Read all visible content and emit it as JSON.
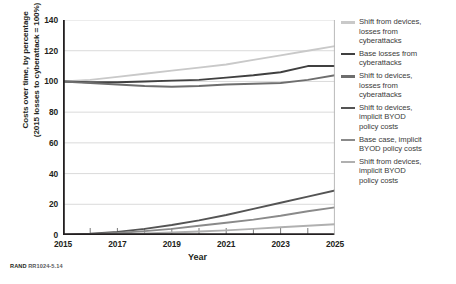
{
  "figure": {
    "source_note_prefix": "RAND",
    "source_note_id": " RR1024-5.14"
  },
  "axes": {
    "y_title_line1": "Costs over time, by percentage",
    "y_title_line2": "(2015 losses to cyberattack = 100%)",
    "x_title": "Year",
    "y_ticks": [
      "140",
      "120",
      "100",
      "80",
      "60",
      "40",
      "20",
      "0"
    ],
    "x_ticks": [
      "2015",
      "2017",
      "2019",
      "2021",
      "2023",
      "2025"
    ]
  },
  "legend": {
    "items": [
      {
        "label": "Shift from devices,\nlosses from\ncyberattacks",
        "color": "#c9c9c9"
      },
      {
        "label": "Base losses from\ncyberattacks",
        "color": "#404040"
      },
      {
        "label": "Shift to devices,\nlosses from\ncyberattacks",
        "color": "#6e6e6e"
      },
      {
        "label": "Shift to devices,\nimplicit BYOD\npolicy costs",
        "color": "#545454"
      },
      {
        "label": "Base case, implicit\nBYOD policy costs",
        "color": "#8a8a8a"
      },
      {
        "label": "Shift from devices,\nimplicit BYOD\npolicy costs",
        "color": "#b0b0b0"
      }
    ]
  },
  "chart_data": {
    "type": "line",
    "title": "",
    "xlabel": "Year",
    "ylabel": "Costs over time, by percentage (2015 losses to cyberattack = 100%)",
    "xlim": [
      2015,
      2025
    ],
    "ylim": [
      0,
      140
    ],
    "y_ticks": [
      0,
      20,
      40,
      60,
      80,
      100,
      120,
      140
    ],
    "x_ticks": [
      2015,
      2017,
      2019,
      2021,
      2023,
      2025
    ],
    "x_minor_ticks": [
      2016,
      2018,
      2020,
      2022,
      2024
    ],
    "grid": "horizontal",
    "legend_position": "right",
    "x": [
      2015,
      2016,
      2017,
      2018,
      2019,
      2020,
      2021,
      2022,
      2023,
      2024,
      2025
    ],
    "series": [
      {
        "name": "Shift from devices, losses from cyberattacks",
        "color": "#c9c9c9",
        "values": [
          100,
          101,
          103,
          105,
          107,
          109,
          111,
          114,
          117,
          120,
          123
        ]
      },
      {
        "name": "Base losses from cyberattacks",
        "color": "#404040",
        "values": [
          100,
          99.5,
          99.5,
          100,
          100.5,
          101,
          102.5,
          104,
          106,
          110,
          110
        ]
      },
      {
        "name": "Shift to devices, losses from cyberattacks",
        "color": "#6e6e6e",
        "values": [
          100,
          99,
          98,
          97,
          96.5,
          97,
          98,
          98.5,
          99,
          101,
          104
        ]
      },
      {
        "name": "Shift to devices, implicit BYOD policy costs",
        "color": "#545454",
        "values": [
          0,
          0.8,
          2,
          4,
          6.5,
          9.5,
          13,
          17,
          21,
          25,
          29
        ]
      },
      {
        "name": "Base case, implicit BYOD policy costs",
        "color": "#8a8a8a",
        "values": [
          0,
          0.5,
          1.3,
          2.5,
          4,
          6,
          8,
          10,
          12.5,
          15.5,
          18
        ]
      },
      {
        "name": "Shift from devices, implicit BYOD policy costs",
        "color": "#b0b0b0",
        "values": [
          0,
          0.2,
          0.5,
          1,
          1.6,
          2.3,
          3,
          4,
          5,
          6,
          7
        ]
      }
    ]
  }
}
